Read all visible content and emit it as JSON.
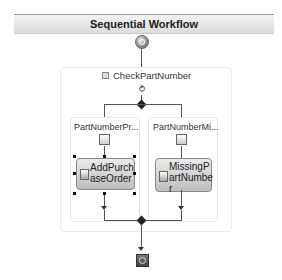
{
  "workflow": {
    "title": "Sequential Workflow",
    "start_icon": "workflow-start-icon",
    "end_icon": "workflow-end-icon"
  },
  "ifelse": {
    "name": "CheckPartNumber",
    "collapse_icon": "collapse-icon",
    "condition_icon": "condition-icon",
    "branches": [
      {
        "name": "PartNumberPr...",
        "activity": {
          "line1": "AddPurch",
          "line2": "aseOrder",
          "line3": "",
          "selected": true
        }
      },
      {
        "name": "PartNumberMi...",
        "activity": {
          "line1": "MissingP",
          "line2": "artNumbe",
          "line3": "r",
          "selected": false
        }
      }
    ]
  }
}
